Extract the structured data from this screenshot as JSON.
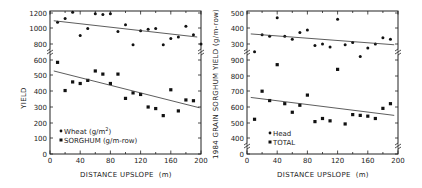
{
  "chart_data": [
    {
      "type": "scatter",
      "panel": "left",
      "title": "",
      "xlabel": "DISTANCE UPSLOPE (m)",
      "ylabel": "YIELD",
      "xlim": [
        0,
        200
      ],
      "x_ticks": [
        0,
        40,
        80,
        120,
        160,
        200
      ],
      "y_ticks_upper": [
        800,
        1000,
        1200
      ],
      "y_ticks_lower": [
        0,
        100,
        200,
        300,
        400,
        500,
        600
      ],
      "axis_break": "between 600 and 800",
      "grid": false,
      "legend_position": "lower-left",
      "series": [
        {
          "name": "Wheat (g/m2)",
          "marker": "small-dot",
          "x": [
            10,
            20,
            30,
            40,
            50,
            60,
            70,
            80,
            90,
            100,
            110,
            120,
            130,
            140,
            150,
            160,
            170,
            180,
            190,
            200
          ],
          "y": [
            1080,
            1130,
            1210,
            910,
            1000,
            1190,
            1180,
            1190,
            960,
            1050,
            790,
            970,
            990,
            1000,
            790,
            870,
            890,
            1030,
            920,
            800
          ],
          "trendline": {
            "x": [
              5,
              195
            ],
            "y": [
              1100,
              890
            ]
          }
        },
        {
          "name": "SORGHUM (g/m-row)",
          "marker": "square",
          "x": [
            10,
            20,
            30,
            40,
            50,
            60,
            70,
            80,
            90,
            100,
            110,
            120,
            130,
            140,
            150,
            160,
            170,
            180,
            190
          ],
          "y": [
            585,
            405,
            460,
            450,
            470,
            530,
            510,
            450,
            510,
            355,
            390,
            380,
            300,
            290,
            245,
            410,
            275,
            345,
            340
          ],
          "trendline": {
            "x": [
              5,
              198
            ],
            "y": [
              530,
              295
            ]
          }
        }
      ]
    },
    {
      "type": "scatter",
      "panel": "right",
      "title": "",
      "xlabel": "DISTANCE UPSLOPE (m)",
      "ylabel": "1984 GRAIN SORGHUM YIELD (g/m-row)",
      "xlim": [
        0,
        200
      ],
      "x_ticks": [
        0,
        40,
        80,
        120,
        160,
        200
      ],
      "y_ticks_upper": [
        300,
        400,
        500
      ],
      "y_ticks_lower": [
        0,
        400,
        500,
        600,
        700,
        800,
        900
      ],
      "axis_break": "between 300 and 900, and between 0 and 400",
      "grid": false,
      "legend_position": "lower-left",
      "series": [
        {
          "name": "Head",
          "marker": "small-dot",
          "x": [
            10,
            20,
            30,
            40,
            50,
            60,
            70,
            80,
            90,
            100,
            110,
            120,
            130,
            140,
            150,
            160,
            170,
            180,
            190
          ],
          "y": [
            250,
            360,
            350,
            470,
            350,
            330,
            375,
            390,
            290,
            300,
            280,
            460,
            295,
            310,
            220,
            275,
            300,
            340,
            330
          ],
          "trendline": {
            "x": [
              5,
              195
            ],
            "y": [
              365,
              295
            ]
          }
        },
        {
          "name": "TOTAL",
          "marker": "square",
          "x": [
            10,
            20,
            30,
            40,
            50,
            60,
            70,
            80,
            90,
            100,
            110,
            120,
            130,
            140,
            150,
            160,
            170,
            180,
            190
          ],
          "y": [
            520,
            700,
            640,
            870,
            620,
            565,
            610,
            675,
            505,
            525,
            510,
            840,
            490,
            550,
            545,
            540,
            525,
            590,
            620
          ],
          "trendline": {
            "x": [
              5,
              195
            ],
            "y": [
              660,
              545
            ]
          }
        }
      ]
    }
  ],
  "left": {
    "ylabel": "YIELD",
    "xlabel": "DISTANCE UPSLOPE  (m)",
    "legend": [
      {
        "label": "Wheat (g/m",
        "sup": "2",
        "tail": ")"
      },
      {
        "label": "SORGHUM (g/m-row)"
      }
    ],
    "x_tick_labels": [
      "0",
      "40",
      "80",
      "120",
      "160",
      "200"
    ],
    "y_tick_labels": [
      "1200",
      "1000",
      "800",
      "600",
      "500",
      "400",
      "300",
      "200",
      "100",
      "0"
    ]
  },
  "right": {
    "ylabel": "1984 GRAIN SORGHUM YIELD (g/m-row)",
    "xlabel": "DISTANCE UPSLOPE  (m)",
    "legend": [
      {
        "label": "Head"
      },
      {
        "label": "TOTAL"
      }
    ],
    "x_tick_labels": [
      "0",
      "40",
      "80",
      "120",
      "160",
      "200"
    ],
    "y_tick_labels": [
      "500",
      "400",
      "300",
      "900",
      "800",
      "700",
      "600",
      "500",
      "400",
      "0"
    ]
  }
}
